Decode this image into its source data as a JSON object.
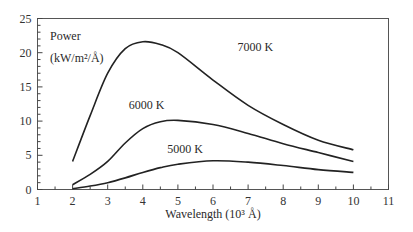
{
  "chart_data": {
    "type": "line",
    "title": "",
    "xlabel": "Wavelength (10³ Å)",
    "ylabel": "Power (kW/m²/Å)",
    "ylabel_line1": "Power",
    "ylabel_line2": "(kW/m²/Å)",
    "xlim": [
      1,
      11
    ],
    "ylim": [
      0,
      25
    ],
    "x_ticks": [
      1,
      2,
      3,
      4,
      5,
      6,
      7,
      8,
      9,
      10,
      11
    ],
    "y_ticks": [
      0,
      5,
      10,
      15,
      20,
      25
    ],
    "grid": false,
    "legend": "inline labels on curves",
    "x": [
      2,
      2.5,
      3,
      3.5,
      4,
      4.5,
      5,
      6,
      7,
      8,
      9,
      10
    ],
    "series": [
      {
        "name": "7000 K",
        "label": "7000 K",
        "label_pos": [
          6.7,
          20.3
        ],
        "values": [
          4.1,
          10.8,
          17.0,
          20.6,
          21.6,
          21.2,
          20.0,
          16.0,
          12.3,
          9.5,
          7.2,
          5.8
        ]
      },
      {
        "name": "6000 K",
        "label": "6000 K",
        "label_pos": [
          3.6,
          11.8
        ],
        "values": [
          0.7,
          2.2,
          4.1,
          6.8,
          8.9,
          9.9,
          10.1,
          9.5,
          8.2,
          6.7,
          5.4,
          4.1
        ]
      },
      {
        "name": "5000 K",
        "label": "5000 K",
        "label_pos": [
          4.7,
          5.4
        ],
        "values": [
          0.1,
          0.5,
          1.0,
          1.7,
          2.5,
          3.2,
          3.7,
          4.2,
          4.0,
          3.5,
          2.9,
          2.5
        ]
      }
    ]
  }
}
